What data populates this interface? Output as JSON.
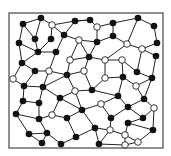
{
  "diagram": {
    "type": "planar-graph-network",
    "frame": {
      "x": 9,
      "y": 13,
      "width": 154,
      "height": 135,
      "stroke": "#555555"
    },
    "colors": {
      "edge": "#222222",
      "black_node": "#111111",
      "white_node_fill": "#ffffff",
      "white_node_stroke": "#222222",
      "background": "#ffffff"
    },
    "node_radius": 3.3,
    "nodes": [
      {
        "id": "b1",
        "x": 23,
        "y": 24,
        "color": "black"
      },
      {
        "id": "b2",
        "x": 41,
        "y": 18,
        "color": "black"
      },
      {
        "id": "b3",
        "x": 19,
        "y": 43,
        "color": "black"
      },
      {
        "id": "b4",
        "x": 35,
        "y": 39,
        "color": "black"
      },
      {
        "id": "b5",
        "x": 51,
        "y": 39,
        "color": "black"
      },
      {
        "id": "b6",
        "x": 38,
        "y": 52,
        "color": "black"
      },
      {
        "id": "b7",
        "x": 22,
        "y": 63,
        "color": "black"
      },
      {
        "id": "b8",
        "x": 35,
        "y": 71,
        "color": "black"
      },
      {
        "id": "b9",
        "x": 56,
        "y": 52,
        "color": "black"
      },
      {
        "id": "b10",
        "x": 64,
        "y": 35,
        "color": "black"
      },
      {
        "id": "b11",
        "x": 75,
        "y": 21,
        "color": "black"
      },
      {
        "id": "b12",
        "x": 90,
        "y": 20,
        "color": "black"
      },
      {
        "id": "b13",
        "x": 113,
        "y": 23,
        "color": "black"
      },
      {
        "id": "b14",
        "x": 138,
        "y": 18,
        "color": "black"
      },
      {
        "id": "b15",
        "x": 154,
        "y": 26,
        "color": "black"
      },
      {
        "id": "b16",
        "x": 97,
        "y": 42,
        "color": "black"
      },
      {
        "id": "b17",
        "x": 113,
        "y": 36,
        "color": "black"
      },
      {
        "id": "b18",
        "x": 157,
        "y": 43,
        "color": "black"
      },
      {
        "id": "b19",
        "x": 89,
        "y": 57,
        "color": "black"
      },
      {
        "id": "b20",
        "x": 156,
        "y": 56,
        "color": "black"
      },
      {
        "id": "b21",
        "x": 67,
        "y": 75,
        "color": "black"
      },
      {
        "id": "b22",
        "x": 43,
        "y": 87,
        "color": "black"
      },
      {
        "id": "b23",
        "x": 24,
        "y": 86,
        "color": "black"
      },
      {
        "id": "b24",
        "x": 137,
        "y": 72,
        "color": "black"
      },
      {
        "id": "b25",
        "x": 123,
        "y": 77,
        "color": "black"
      },
      {
        "id": "b26",
        "x": 152,
        "y": 78,
        "color": "black"
      },
      {
        "id": "b27",
        "x": 92,
        "y": 90,
        "color": "black"
      },
      {
        "id": "b28",
        "x": 60,
        "y": 98,
        "color": "black"
      },
      {
        "id": "b29",
        "x": 118,
        "y": 96,
        "color": "black"
      },
      {
        "id": "b30",
        "x": 144,
        "y": 99,
        "color": "black"
      },
      {
        "id": "b31",
        "x": 23,
        "y": 101,
        "color": "black"
      },
      {
        "id": "b32",
        "x": 39,
        "y": 103,
        "color": "black"
      },
      {
        "id": "b33",
        "x": 128,
        "y": 107,
        "color": "black"
      },
      {
        "id": "b34",
        "x": 82,
        "y": 110,
        "color": "black"
      },
      {
        "id": "b35",
        "x": 16,
        "y": 114,
        "color": "black"
      },
      {
        "id": "b36",
        "x": 39,
        "y": 119,
        "color": "black"
      },
      {
        "id": "b37",
        "x": 67,
        "y": 118,
        "color": "black"
      },
      {
        "id": "b38",
        "x": 111,
        "y": 118,
        "color": "black"
      },
      {
        "id": "b39",
        "x": 143,
        "y": 118,
        "color": "black"
      },
      {
        "id": "b40",
        "x": 128,
        "y": 123,
        "color": "black"
      },
      {
        "id": "b41",
        "x": 95,
        "y": 128,
        "color": "black"
      },
      {
        "id": "b42",
        "x": 153,
        "y": 130,
        "color": "black"
      },
      {
        "id": "b43",
        "x": 29,
        "y": 134,
        "color": "black"
      },
      {
        "id": "b44",
        "x": 47,
        "y": 133,
        "color": "black"
      },
      {
        "id": "b45",
        "x": 76,
        "y": 137,
        "color": "black"
      },
      {
        "id": "b46",
        "x": 42,
        "y": 143,
        "color": "black"
      },
      {
        "id": "b47",
        "x": 61,
        "y": 144,
        "color": "black"
      },
      {
        "id": "b48",
        "x": 99,
        "y": 144,
        "color": "black"
      },
      {
        "id": "w1",
        "x": 52,
        "y": 25,
        "color": "white"
      },
      {
        "id": "w2",
        "x": 97,
        "y": 27,
        "color": "white"
      },
      {
        "id": "w3",
        "x": 79,
        "y": 40,
        "color": "white"
      },
      {
        "id": "w4",
        "x": 127,
        "y": 44,
        "color": "white"
      },
      {
        "id": "w5",
        "x": 142,
        "y": 49,
        "color": "white"
      },
      {
        "id": "w6",
        "x": 70,
        "y": 60,
        "color": "white"
      },
      {
        "id": "w7",
        "x": 105,
        "y": 60,
        "color": "white"
      },
      {
        "id": "w8",
        "x": 122,
        "y": 60,
        "color": "white"
      },
      {
        "id": "w9",
        "x": 49,
        "y": 71,
        "color": "white"
      },
      {
        "id": "w10",
        "x": 84,
        "y": 71,
        "color": "white"
      },
      {
        "id": "w11",
        "x": 13,
        "y": 79,
        "color": "white"
      },
      {
        "id": "w12",
        "x": 105,
        "y": 78,
        "color": "white"
      },
      {
        "id": "w13",
        "x": 136,
        "y": 86,
        "color": "white"
      },
      {
        "id": "w14",
        "x": 75,
        "y": 91,
        "color": "white"
      },
      {
        "id": "w15",
        "x": 101,
        "y": 104,
        "color": "white"
      },
      {
        "id": "w16",
        "x": 154,
        "y": 108,
        "color": "white"
      },
      {
        "id": "w17",
        "x": 52,
        "y": 115,
        "color": "white"
      },
      {
        "id": "w18",
        "x": 110,
        "y": 130,
        "color": "white"
      },
      {
        "id": "w19",
        "x": 125,
        "y": 135,
        "color": "white"
      },
      {
        "id": "w20",
        "x": 138,
        "y": 142,
        "color": "white"
      },
      {
        "id": "w21",
        "x": 125,
        "y": 145,
        "color": "white"
      }
    ],
    "edges": [
      [
        "b1",
        "b2"
      ],
      [
        "b1",
        "b3"
      ],
      [
        "b1",
        "b4"
      ],
      [
        "b2",
        "w1"
      ],
      [
        "b2",
        "b4"
      ],
      [
        "w1",
        "b5"
      ],
      [
        "w1",
        "b11"
      ],
      [
        "w1",
        "b10"
      ],
      [
        "b4",
        "b6"
      ],
      [
        "b3",
        "b6"
      ],
      [
        "b3",
        "b7"
      ],
      [
        "b5",
        "b6"
      ],
      [
        "b6",
        "b9"
      ],
      [
        "b6",
        "b7"
      ],
      [
        "b7",
        "b8"
      ],
      [
        "b8",
        "w9"
      ],
      [
        "b9",
        "b10"
      ],
      [
        "b9",
        "w9"
      ],
      [
        "b10",
        "w3"
      ],
      [
        "b10",
        "b11"
      ],
      [
        "b11",
        "b12"
      ],
      [
        "b12",
        "w2"
      ],
      [
        "w2",
        "b13"
      ],
      [
        "w2",
        "b16"
      ],
      [
        "b13",
        "b14"
      ],
      [
        "b13",
        "b17"
      ],
      [
        "b14",
        "b15"
      ],
      [
        "b15",
        "b18"
      ],
      [
        "b17",
        "w4"
      ],
      [
        "b16",
        "b17"
      ],
      [
        "b16",
        "w3"
      ],
      [
        "w3",
        "w6"
      ],
      [
        "w3",
        "b19"
      ],
      [
        "b16",
        "b19"
      ],
      [
        "w4",
        "w5"
      ],
      [
        "w4",
        "w7"
      ],
      [
        "w5",
        "b18"
      ],
      [
        "w5",
        "b20"
      ],
      [
        "b19",
        "w6"
      ],
      [
        "b19",
        "w7"
      ],
      [
        "w6",
        "b21"
      ],
      [
        "w9",
        "b21"
      ],
      [
        "w9",
        "b22"
      ],
      [
        "b8",
        "b23"
      ],
      [
        "w11",
        "b7"
      ],
      [
        "w11",
        "b23"
      ],
      [
        "b23",
        "b22"
      ],
      [
        "b22",
        "b21"
      ],
      [
        "b21",
        "w10"
      ],
      [
        "w10",
        "b19"
      ],
      [
        "w10",
        "b27"
      ],
      [
        "w7",
        "w8"
      ],
      [
        "w8",
        "b25"
      ],
      [
        "w8",
        "b24"
      ],
      [
        "b24",
        "b26"
      ],
      [
        "b24",
        "w5"
      ],
      [
        "b20",
        "b26"
      ],
      [
        "w7",
        "w12"
      ],
      [
        "w12",
        "b25"
      ],
      [
        "w12",
        "b27"
      ],
      [
        "b25",
        "w13"
      ],
      [
        "w13",
        "b26"
      ],
      [
        "w13",
        "b30"
      ],
      [
        "b26",
        "b30"
      ],
      [
        "b27",
        "w14"
      ],
      [
        "b21",
        "w14"
      ],
      [
        "w14",
        "b28"
      ],
      [
        "b22",
        "b28"
      ],
      [
        "b22",
        "b32"
      ],
      [
        "b23",
        "b31"
      ],
      [
        "b31",
        "b32"
      ],
      [
        "b31",
        "b35"
      ],
      [
        "b32",
        "b36"
      ],
      [
        "b28",
        "w17"
      ],
      [
        "b28",
        "b34"
      ],
      [
        "w14",
        "b34"
      ],
      [
        "b27",
        "b29"
      ],
      [
        "b25",
        "b29"
      ],
      [
        "b29",
        "b33"
      ],
      [
        "b29",
        "w15"
      ],
      [
        "b34",
        "w15"
      ],
      [
        "b33",
        "b30"
      ],
      [
        "b33",
        "b39"
      ],
      [
        "b30",
        "w16"
      ],
      [
        "w16",
        "b42"
      ],
      [
        "b39",
        "w16"
      ],
      [
        "b39",
        "b40"
      ],
      [
        "b33",
        "b38"
      ],
      [
        "w15",
        "b38"
      ],
      [
        "b38",
        "w18"
      ],
      [
        "b40",
        "w19"
      ],
      [
        "b40",
        "b42"
      ],
      [
        "b42",
        "w20"
      ],
      [
        "w19",
        "w20"
      ],
      [
        "w18",
        "w19"
      ],
      [
        "w19",
        "w21"
      ],
      [
        "w18",
        "b48"
      ],
      [
        "b34",
        "b37"
      ],
      [
        "b37",
        "w17"
      ],
      [
        "w17",
        "b36"
      ],
      [
        "b36",
        "b35"
      ],
      [
        "b36",
        "b44"
      ],
      [
        "b35",
        "b43"
      ],
      [
        "b43",
        "b44"
      ],
      [
        "b43",
        "b46"
      ],
      [
        "b44",
        "b46"
      ],
      [
        "b44",
        "b47"
      ],
      [
        "b37",
        "b45"
      ],
      [
        "b45",
        "b47"
      ],
      [
        "b45",
        "b41"
      ],
      [
        "b34",
        "b41"
      ],
      [
        "b41",
        "w18"
      ],
      [
        "b41",
        "b48"
      ],
      [
        "b48",
        "w21"
      ],
      [
        "w21",
        "w20"
      ],
      [
        "b12",
        "b11"
      ],
      [
        "b14",
        "w4"
      ]
    ]
  }
}
